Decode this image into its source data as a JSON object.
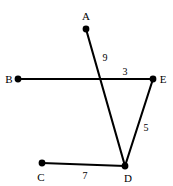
{
  "figure": {
    "background_color": "#ffffff",
    "stroke_color": "#000000",
    "width": 173,
    "height": 186,
    "vertices": [
      {
        "id": "A",
        "label": "A",
        "x": 86,
        "y": 29,
        "label_x": 86,
        "label_y": 16
      },
      {
        "id": "B",
        "label": "B",
        "x": 18,
        "y": 79,
        "label_x": 9,
        "label_y": 79
      },
      {
        "id": "C",
        "label": "C",
        "x": 42,
        "y": 163,
        "label_x": 41,
        "label_y": 177
      },
      {
        "id": "D",
        "label": "D",
        "x": 125,
        "y": 166,
        "label_x": 128,
        "label_y": 178
      },
      {
        "id": "E",
        "label": "E",
        "x": 153,
        "y": 79,
        "label_x": 163,
        "label_y": 79
      }
    ],
    "segments": [
      {
        "id": "AD",
        "from": "A",
        "to": "D",
        "x1": 86,
        "y1": 29,
        "x2": 125,
        "y2": 166
      },
      {
        "id": "BE",
        "from": "B",
        "to": "E",
        "x1": 18,
        "y1": 79,
        "x2": 153,
        "y2": 79
      },
      {
        "id": "ED",
        "from": "E",
        "to": "D",
        "x1": 153,
        "y1": 79,
        "x2": 125,
        "y2": 166
      },
      {
        "id": "CD",
        "from": "C",
        "to": "D",
        "x1": 42,
        "y1": 163,
        "x2": 125,
        "y2": 166
      }
    ],
    "length_labels": [
      {
        "id": "len-9",
        "segment": "AD",
        "value": "9",
        "x": 105,
        "y": 58
      },
      {
        "id": "len-3",
        "segment": "BE",
        "value": "3",
        "x": 125,
        "y": 72
      },
      {
        "id": "len-5",
        "segment": "ED",
        "value": "5",
        "x": 146,
        "y": 128
      },
      {
        "id": "len-7",
        "segment": "CD",
        "value": "7",
        "x": 85,
        "y": 176
      }
    ]
  }
}
